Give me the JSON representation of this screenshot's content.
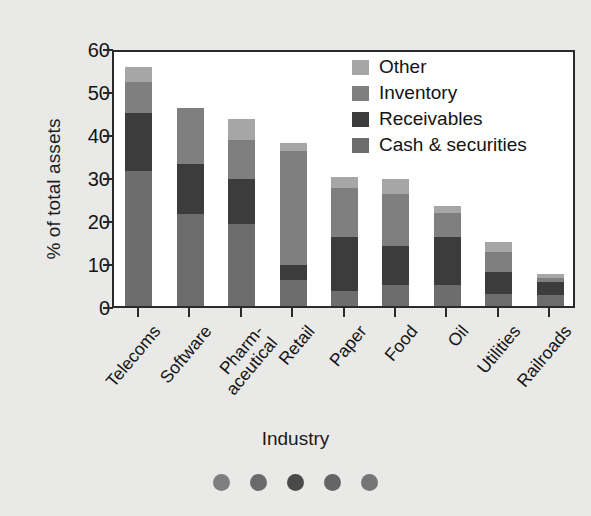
{
  "chart_data": {
    "type": "bar",
    "subtype": "stacked-vertical",
    "title": "",
    "xlabel": "Industry",
    "ylabel": "% of total assets",
    "ylim": [
      0,
      60
    ],
    "yticks": [
      0,
      10,
      20,
      30,
      40,
      50,
      60
    ],
    "grid": false,
    "legend_position": "top-right",
    "categories": [
      "Telecoms",
      "Software",
      "Pharm-\naceutical",
      "Retail",
      "Paper",
      "Food",
      "Oil",
      "Utilities",
      "Railroads"
    ],
    "series": [
      {
        "name": "Cash & securities",
        "color": "#6d6d6d",
        "values": [
          31.3,
          21.5,
          19.0,
          6.0,
          3.5,
          5.0,
          5.0,
          2.7,
          2.5
        ]
      },
      {
        "name": "Receivables",
        "color": "#3c3c3c",
        "values": [
          13.7,
          11.5,
          10.5,
          3.5,
          12.5,
          9.0,
          11.0,
          5.3,
          3.0
        ]
      },
      {
        "name": "Inventory",
        "color": "#7f7f7f",
        "values": [
          7.0,
          13.0,
          9.0,
          26.5,
          11.5,
          12.0,
          5.7,
          4.5,
          1.0
        ]
      },
      {
        "name": "Other",
        "color": "#a6a6a6",
        "values": [
          3.5,
          0.0,
          5.0,
          2.0,
          2.5,
          3.5,
          1.5,
          2.3,
          1.0
        ]
      }
    ],
    "totals": [
      55.5,
      46.0,
      43.5,
      38.0,
      30.0,
      29.5,
      23.2,
      14.8,
      7.5
    ]
  },
  "legend": {
    "items": [
      {
        "label": "Other",
        "color": "#a6a6a6"
      },
      {
        "label": "Inventory",
        "color": "#7f7f7f"
      },
      {
        "label": "Receivables",
        "color": "#3c3c3c"
      },
      {
        "label": "Cash & securities",
        "color": "#6d6d6d"
      }
    ]
  },
  "axes": {
    "y_title": "% of total assets",
    "x_title": "Industry",
    "y_tick_labels": [
      "60",
      "50",
      "40",
      "30",
      "20",
      "10",
      "0"
    ]
  },
  "footer_dots": [
    {
      "color": "#7e7e7e"
    },
    {
      "color": "#6a6a6a"
    },
    {
      "color": "#4a4a4a"
    },
    {
      "color": "#656565"
    },
    {
      "color": "#767676"
    }
  ],
  "colors": {
    "background": "#e9e9e7",
    "plot_background": "#ffffff",
    "axis": "#2a2a2a",
    "text": "#151515"
  }
}
